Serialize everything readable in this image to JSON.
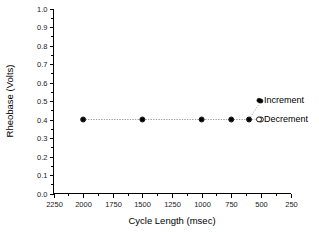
{
  "chart_data": {
    "type": "scatter",
    "title": "",
    "xlabel": "Cycle Length (msec)",
    "ylabel": "Rheobase (Volts)",
    "xlim": [
      2250,
      250
    ],
    "ylim": [
      0.0,
      1.0
    ],
    "x_reversed": true,
    "grid": false,
    "legend_position": "inline-right",
    "x_ticks": [
      2250,
      2000,
      1750,
      1500,
      1250,
      1000,
      750,
      500,
      250
    ],
    "x_tick_labels": [
      "2250",
      "2000",
      "1750",
      "1500",
      "1250",
      "1000",
      "750",
      "500",
      "250"
    ],
    "x_minor_interval": 125,
    "y_ticks": [
      0.0,
      0.1,
      0.2,
      0.3,
      0.4,
      0.5,
      0.6,
      0.7,
      0.8,
      0.9,
      1.0
    ],
    "y_tick_labels": [
      "0.0",
      "0.1",
      "0.2",
      "0.3",
      "0.4",
      "0.5",
      "0.6",
      "0.7",
      "0.8",
      "0.9",
      "1.0"
    ],
    "y_minor_interval": 0.05,
    "series": [
      {
        "name": "Increment",
        "marker": "filled-circle",
        "color": "#000000",
        "x": [
          2000,
          1500,
          1000,
          750,
          600,
          500
        ],
        "values": [
          0.4,
          0.4,
          0.4,
          0.4,
          0.4,
          0.5
        ]
      },
      {
        "name": "Decrement",
        "marker": "open-circle",
        "color": "#000000",
        "x": [
          2000,
          1500,
          1000,
          750,
          600,
          500
        ],
        "values": [
          0.4,
          0.4,
          0.4,
          0.4,
          0.4,
          0.4
        ]
      }
    ],
    "legend": [
      {
        "label": "Increment",
        "marker": "filled-circle"
      },
      {
        "label": "Decrement",
        "marker": "open-circle"
      }
    ]
  },
  "colors": {
    "background": "#ffffff",
    "axis": "#000000",
    "text": "#000000",
    "connector": "#9a9a9a"
  }
}
